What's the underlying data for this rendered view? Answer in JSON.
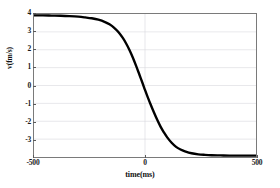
{
  "chart_data": {
    "type": "line",
    "title": "",
    "xlabel": "time(ms)",
    "ylabel": "v(fm/s)",
    "xlim": [
      -500,
      500
    ],
    "ylim": [
      -4,
      4
    ],
    "grid": true,
    "legend": "none",
    "line_color": "#000000",
    "line_width": 2.4,
    "x_ticks": [
      {
        "value": -500,
        "label": "-500"
      },
      {
        "value": 0,
        "label": "0"
      },
      {
        "value": 500,
        "label": "500"
      }
    ],
    "y_ticks": [
      {
        "value": 4,
        "label": "4"
      },
      {
        "value": 3,
        "label": "3"
      },
      {
        "value": 2,
        "label": "2"
      },
      {
        "value": 1,
        "label": "1"
      },
      {
        "value": 0,
        "label": "0"
      },
      {
        "value": -1,
        "label": "-1"
      },
      {
        "value": -2,
        "label": "-2"
      },
      {
        "value": -3,
        "label": "-3"
      }
    ],
    "series": [
      {
        "name": "v",
        "x": [
          -500,
          -460,
          -420,
          -380,
          -340,
          -300,
          -270,
          -240,
          -210,
          -180,
          -160,
          -140,
          -120,
          -100,
          -85,
          -70,
          -55,
          -40,
          -25,
          -10,
          0,
          10,
          25,
          40,
          55,
          70,
          85,
          100,
          120,
          140,
          160,
          180,
          210,
          240,
          270,
          300,
          340,
          380,
          420,
          460,
          500
        ],
        "y": [
          3.92,
          3.92,
          3.91,
          3.9,
          3.88,
          3.85,
          3.81,
          3.76,
          3.68,
          3.55,
          3.42,
          3.24,
          2.99,
          2.66,
          2.35,
          1.99,
          1.57,
          1.1,
          0.6,
          0.1,
          -0.25,
          -0.58,
          -1.05,
          -1.5,
          -1.92,
          -2.3,
          -2.62,
          -2.9,
          -3.2,
          -3.43,
          -3.58,
          -3.68,
          -3.79,
          -3.85,
          -3.88,
          -3.9,
          -3.91,
          -3.92,
          -3.92,
          -3.92,
          -3.92
        ]
      }
    ]
  }
}
